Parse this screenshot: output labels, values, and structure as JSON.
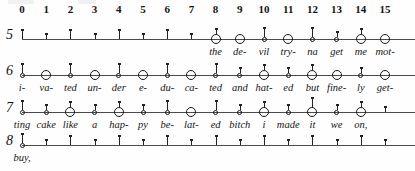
{
  "figure": {
    "kind": "metrical-grid-notation",
    "column_numbers": [
      "0",
      "1",
      "2",
      "3",
      "4",
      "5",
      "6",
      "7",
      "8",
      "9",
      "10",
      "11",
      "12",
      "13",
      "14",
      "15"
    ],
    "grid": {
      "x_start_px": 22,
      "x_step_px": 24.2,
      "columns": 16
    },
    "colors": {
      "ink": "#141414",
      "staff_line": "#4a4a4a",
      "notehead_stroke": "#1a1a1a"
    },
    "rows": [
      {
        "label": "5",
        "line_y": 39,
        "line_x_start": 22,
        "line_x_end": 415,
        "marks": [
          {
            "col": 0,
            "type": "tick",
            "stem": "long",
            "lyric": ""
          },
          {
            "col": 1,
            "type": "tick",
            "stem": "short",
            "lyric": ""
          },
          {
            "col": 2,
            "type": "tick",
            "stem": "long",
            "lyric": ""
          },
          {
            "col": 3,
            "type": "tick",
            "stem": "short",
            "lyric": ""
          },
          {
            "col": 4,
            "type": "tick",
            "stem": "long",
            "lyric": ""
          },
          {
            "col": 5,
            "type": "tick",
            "stem": "short",
            "lyric": ""
          },
          {
            "col": 6,
            "type": "tick",
            "stem": "long",
            "lyric": ""
          },
          {
            "col": 7,
            "type": "tick",
            "stem": "short",
            "lyric": ""
          },
          {
            "col": 8,
            "type": "big-notehead",
            "stem": "short",
            "lyric": "the"
          },
          {
            "col": 9,
            "type": "big-notehead",
            "stem": "none",
            "lyric": "de-"
          },
          {
            "col": 10,
            "type": "small-notehead",
            "stem": "long",
            "lyric": "vil"
          },
          {
            "col": 11,
            "type": "big-notehead",
            "stem": "none",
            "lyric": "try-"
          },
          {
            "col": 12,
            "type": "small-notehead",
            "stem": "long",
            "lyric": "na"
          },
          {
            "col": 13,
            "type": "small-notehead",
            "stem": "short",
            "lyric": "get"
          },
          {
            "col": 14,
            "type": "big-notehead",
            "stem": "short",
            "lyric": "me"
          },
          {
            "col": 15,
            "type": "big-notehead",
            "stem": "none",
            "lyric": "mot-"
          }
        ]
      },
      {
        "label": "6",
        "line_y": 75,
        "line_x_start": 22,
        "line_x_end": 415,
        "marks": [
          {
            "col": 0,
            "type": "small-notehead",
            "stem": "long",
            "lyric": "i-"
          },
          {
            "col": 1,
            "type": "big-notehead",
            "stem": "none",
            "lyric": "va-"
          },
          {
            "col": 2,
            "type": "small-notehead",
            "stem": "long",
            "lyric": "ted"
          },
          {
            "col": 3,
            "type": "big-notehead",
            "stem": "none",
            "lyric": "un-"
          },
          {
            "col": 4,
            "type": "small-notehead",
            "stem": "long",
            "lyric": "der"
          },
          {
            "col": 5,
            "type": "big-notehead",
            "stem": "none",
            "lyric": "e-"
          },
          {
            "col": 6,
            "type": "small-notehead",
            "stem": "long",
            "lyric": "du-"
          },
          {
            "col": 7,
            "type": "big-notehead",
            "stem": "none",
            "lyric": "ca-"
          },
          {
            "col": 8,
            "type": "small-notehead",
            "stem": "long",
            "lyric": "ted"
          },
          {
            "col": 9,
            "type": "small-notehead",
            "stem": "short",
            "lyric": "and"
          },
          {
            "col": 10,
            "type": "big-notehead",
            "stem": "short",
            "lyric": "hat-"
          },
          {
            "col": 11,
            "type": "small-notehead",
            "stem": "short",
            "lyric": "ed"
          },
          {
            "col": 12,
            "type": "big-notehead",
            "stem": "short",
            "lyric": "but"
          },
          {
            "col": 13,
            "type": "big-notehead",
            "stem": "none",
            "lyric": "fine-"
          },
          {
            "col": 14,
            "type": "small-notehead",
            "stem": "short",
            "lyric": "ly"
          },
          {
            "col": 15,
            "type": "big-notehead",
            "stem": "none",
            "lyric": "get-"
          }
        ]
      },
      {
        "label": "7",
        "line_y": 112,
        "line_x_start": 22,
        "line_x_end": 415,
        "marks": [
          {
            "col": 0,
            "type": "small-notehead",
            "stem": "long",
            "lyric": "ting"
          },
          {
            "col": 1,
            "type": "small-notehead",
            "stem": "short",
            "lyric": "cake"
          },
          {
            "col": 2,
            "type": "big-notehead",
            "stem": "short",
            "lyric": "like"
          },
          {
            "col": 3,
            "type": "small-notehead",
            "stem": "short",
            "lyric": "a"
          },
          {
            "col": 4,
            "type": "big-notehead",
            "stem": "short",
            "lyric": "hap-"
          },
          {
            "col": 5,
            "type": "small-notehead",
            "stem": "short",
            "lyric": "py"
          },
          {
            "col": 6,
            "type": "small-notehead",
            "stem": "long",
            "lyric": "be-"
          },
          {
            "col": 7,
            "type": "big-notehead",
            "stem": "none",
            "lyric": "lat-"
          },
          {
            "col": 8,
            "type": "small-notehead",
            "stem": "long",
            "lyric": "ed"
          },
          {
            "col": 9,
            "type": "small-notehead",
            "stem": "short",
            "lyric": "bitch"
          },
          {
            "col": 10,
            "type": "big-notehead",
            "stem": "short",
            "lyric": "i"
          },
          {
            "col": 11,
            "type": "small-notehead",
            "stem": "short",
            "lyric": "made"
          },
          {
            "col": 12,
            "type": "big-notehead",
            "stem": "long",
            "lyric": "it"
          },
          {
            "col": 13,
            "type": "small-notehead",
            "stem": "short",
            "lyric": "we"
          },
          {
            "col": 14,
            "type": "big-notehead",
            "stem": "short",
            "lyric": "on,"
          },
          {
            "col": 15,
            "type": "tick",
            "stem": "short",
            "lyric": ""
          }
        ]
      },
      {
        "label": "8",
        "line_y": 145,
        "line_x_start": 22,
        "line_x_end": 415,
        "marks": [
          {
            "col": 0,
            "type": "small-notehead",
            "stem": "long",
            "lyric": "buy,"
          },
          {
            "col": 1,
            "type": "tick",
            "stem": "short",
            "lyric": ""
          },
          {
            "col": 2,
            "type": "tick",
            "stem": "long",
            "lyric": ""
          },
          {
            "col": 3,
            "type": "tick",
            "stem": "short",
            "lyric": ""
          },
          {
            "col": 4,
            "type": "tick",
            "stem": "long",
            "lyric": ""
          },
          {
            "col": 5,
            "type": "tick",
            "stem": "short",
            "lyric": ""
          },
          {
            "col": 6,
            "type": "tick",
            "stem": "long",
            "lyric": ""
          },
          {
            "col": 7,
            "type": "tick",
            "stem": "short",
            "lyric": ""
          },
          {
            "col": 8,
            "type": "tick",
            "stem": "long",
            "lyric": ""
          },
          {
            "col": 9,
            "type": "tick",
            "stem": "short",
            "lyric": ""
          },
          {
            "col": 10,
            "type": "tick",
            "stem": "long",
            "lyric": ""
          },
          {
            "col": 11,
            "type": "tick",
            "stem": "short",
            "lyric": ""
          },
          {
            "col": 12,
            "type": "tick",
            "stem": "long",
            "lyric": ""
          },
          {
            "col": 13,
            "type": "tick",
            "stem": "short",
            "lyric": ""
          },
          {
            "col": 14,
            "type": "tick",
            "stem": "long",
            "lyric": ""
          },
          {
            "col": 15,
            "type": "tick",
            "stem": "short",
            "lyric": ""
          }
        ]
      }
    ]
  }
}
